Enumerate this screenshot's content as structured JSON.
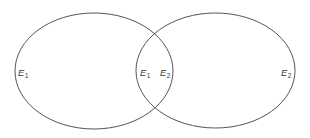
{
  "diagram": {
    "type": "venn",
    "stroke_color": "#555555",
    "background": "#ffffff",
    "sets": [
      {
        "name": "E1",
        "letter": "E",
        "subscript": "1"
      },
      {
        "name": "E2",
        "letter": "E",
        "subscript": "2"
      }
    ],
    "labels": [
      {
        "id": "left-outer",
        "letter": "E",
        "subscript": "1"
      },
      {
        "id": "intersection-left",
        "letter": "E",
        "subscript": "1"
      },
      {
        "id": "intersection-right",
        "letter": "E",
        "subscript": "2"
      },
      {
        "id": "right-outer",
        "letter": "E",
        "subscript": "2"
      }
    ]
  }
}
